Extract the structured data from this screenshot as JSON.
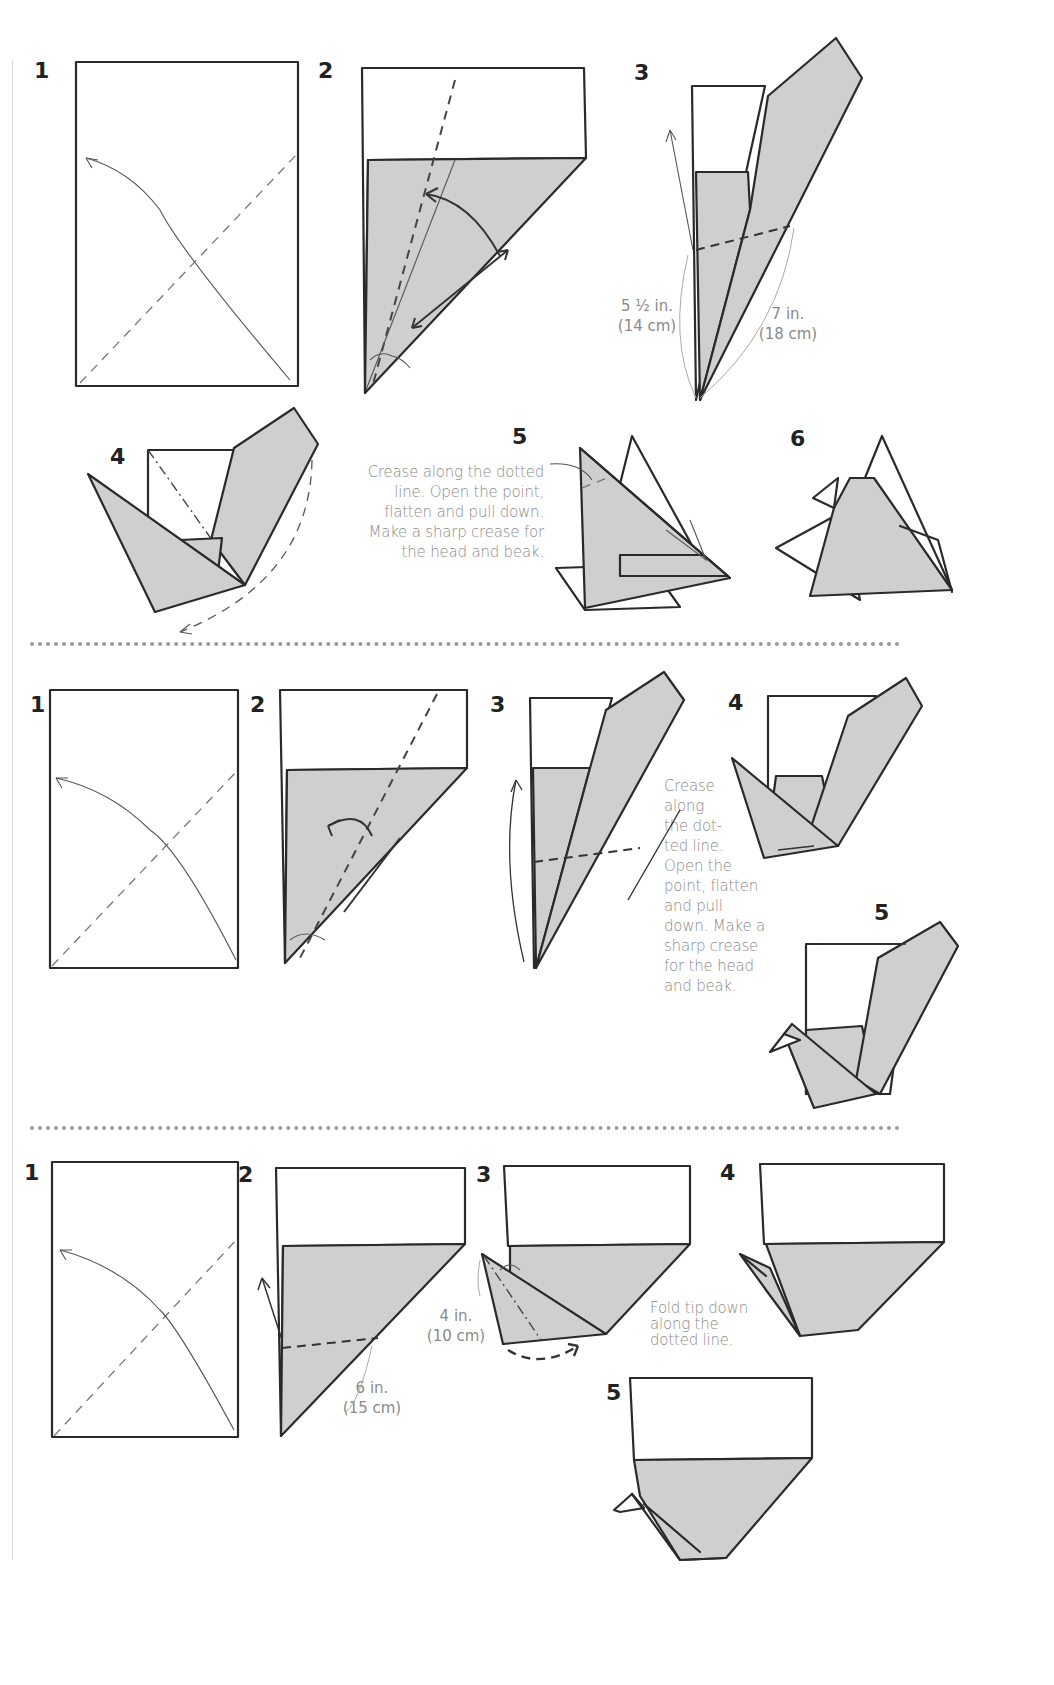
{
  "diagram": {
    "type": "origami-instructions",
    "sections": [
      {
        "id": "section-1",
        "steps": [
          {
            "number": "1"
          },
          {
            "number": "2"
          },
          {
            "number": "3",
            "measurements": [
              {
                "line1": "5 ½ in.",
                "line2": "(14 cm)"
              },
              {
                "line1": "7 in.",
                "line2": "(18 cm)"
              }
            ]
          },
          {
            "number": "4"
          },
          {
            "number": "5",
            "note": [
              "Crease along the dotted",
              "line. Open the point,",
              "flatten and pull down.",
              "Make a sharp crease for",
              "the head and beak."
            ]
          },
          {
            "number": "6"
          }
        ]
      },
      {
        "id": "section-2",
        "steps": [
          {
            "number": "1"
          },
          {
            "number": "2"
          },
          {
            "number": "3"
          },
          {
            "number": "4",
            "note": [
              "Crease",
              "along",
              "the dot-",
              "ted line.",
              "Open the",
              "point, flatten",
              "and pull",
              "down. Make a",
              "sharp crease",
              "for the head",
              "and beak."
            ]
          },
          {
            "number": "5"
          }
        ]
      },
      {
        "id": "section-3",
        "steps": [
          {
            "number": "1"
          },
          {
            "number": "2",
            "measurements": [
              {
                "line1": "6 in.",
                "line2": "(15 cm)"
              }
            ]
          },
          {
            "number": "3",
            "measurements": [
              {
                "line1": "4 in.",
                "line2": "(10 cm)"
              }
            ]
          },
          {
            "number": "4",
            "note": [
              "Fold tip down",
              "along the",
              "dotted line."
            ]
          },
          {
            "number": "5"
          }
        ]
      }
    ],
    "colors": {
      "paper_fill": "#cfcfcf",
      "outline": "#2a2a2a",
      "annotation_text": "#8a8a8a",
      "divider": "#9a9a9a"
    }
  }
}
